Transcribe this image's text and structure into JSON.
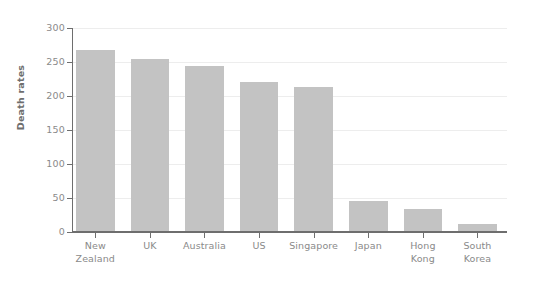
{
  "chart_data": {
    "type": "bar",
    "title": "",
    "xlabel": "",
    "ylabel": "Death rates",
    "categories": [
      "New Zealand",
      "UK",
      "Australia",
      "US",
      "Singapore",
      "Japan",
      "Hong Kong",
      "South Korea"
    ],
    "category_lines": [
      [
        "New",
        "Zealand"
      ],
      [
        "UK"
      ],
      [
        "Australia"
      ],
      [
        "US"
      ],
      [
        "Singapore"
      ],
      [
        "Japan"
      ],
      [
        "Hong",
        "Kong"
      ],
      [
        "South",
        "Korea"
      ]
    ],
    "values": [
      268,
      255,
      244,
      220,
      213,
      46,
      34,
      12
    ],
    "ylim": [
      0,
      300
    ],
    "yticks": [
      0,
      50,
      100,
      150,
      200,
      250,
      300
    ],
    "ytick_labels": [
      "0",
      "50",
      "100",
      "150",
      "200",
      "250",
      "300"
    ],
    "grid": "horizontal",
    "legend": "none",
    "bar_color": "#c3c3c3",
    "axis_color": "#6e6e6e",
    "gridline_color": "#ededed",
    "tick_label_color": "#8a8a8a",
    "background_color": "#ffffff"
  }
}
